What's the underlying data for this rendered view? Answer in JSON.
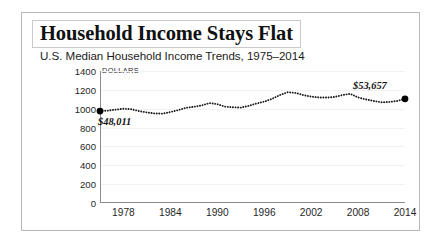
{
  "figure": {
    "title": "Household Income Stays Flat",
    "subtitle": "U.S. Median Household Income Trends, 1975–2014",
    "units_label": "DOLLARS"
  },
  "chart_data": {
    "type": "line",
    "title": "Household Income Stays Flat",
    "subtitle": "U.S. Median Household Income Trends, 1975–2014",
    "xlabel": "",
    "ylabel": "DOLLARS",
    "xlim": [
      1975,
      2014
    ],
    "ylim": [
      0,
      1400
    ],
    "ytick_labels": [
      "1400",
      "1200",
      "1000",
      "800",
      "600",
      "400",
      "200",
      "0"
    ],
    "yticks": [
      1400,
      1200,
      1000,
      800,
      600,
      400,
      200,
      0
    ],
    "xtick_labels": [
      "1978",
      "1984",
      "1990",
      "1996",
      "2002",
      "2008",
      "2014"
    ],
    "xticks": [
      1978,
      1984,
      1990,
      1996,
      2002,
      2008,
      2014
    ],
    "grid": true,
    "legend": false,
    "line_style": "dotted",
    "line_color": "#1a1a1a",
    "marker_color": "#000000",
    "x": [
      1975,
      1976,
      1977,
      1978,
      1979,
      1980,
      1981,
      1982,
      1983,
      1984,
      1985,
      1986,
      1987,
      1988,
      1989,
      1990,
      1991,
      1992,
      1993,
      1994,
      1995,
      1996,
      1997,
      1998,
      1999,
      2000,
      2001,
      2002,
      2003,
      2004,
      2005,
      2006,
      2007,
      2008,
      2009,
      2010,
      2011,
      2012,
      2013,
      2014
    ],
    "values": [
      975,
      980,
      990,
      1000,
      995,
      975,
      960,
      950,
      948,
      965,
      985,
      1010,
      1020,
      1035,
      1060,
      1048,
      1022,
      1015,
      1012,
      1030,
      1055,
      1075,
      1105,
      1145,
      1175,
      1168,
      1145,
      1128,
      1120,
      1118,
      1125,
      1145,
      1158,
      1120,
      1098,
      1082,
      1068,
      1072,
      1082,
      1105
    ],
    "annotations": [
      {
        "label": "$48,011",
        "x": 1975,
        "y": 975,
        "position": "below-right"
      },
      {
        "label": "$53,657",
        "x": 2014,
        "y": 1105,
        "position": "above-left"
      }
    ]
  }
}
